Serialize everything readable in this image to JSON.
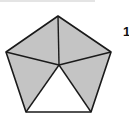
{
  "diagram": {
    "shape": "regular-pentagon",
    "vertices": [
      [
        58,
        16
      ],
      [
        111,
        52
      ],
      [
        91,
        112
      ],
      [
        26,
        112
      ],
      [
        6,
        52
      ]
    ],
    "center": [
      59,
      65
    ],
    "regions": [
      {
        "name": "top-left",
        "shaded": true
      },
      {
        "name": "top-right",
        "shaded": true
      },
      {
        "name": "bottom-right",
        "shaded": true
      },
      {
        "name": "bottom",
        "shaded": false
      },
      {
        "name": "bottom-left",
        "shaded": true
      }
    ],
    "shaded_count": 4,
    "total_regions": 5,
    "colors": {
      "shade": "#c4c4c4",
      "stroke": "#1a1a1a",
      "unshaded": "#ffffff"
    },
    "label": "1"
  }
}
